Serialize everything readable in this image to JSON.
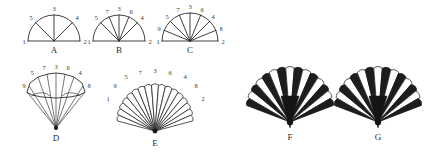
{
  "figure": {
    "background_color": "#ffffff",
    "ink_color": "#2b2b2b",
    "fill_dark_color": "#1d1d1d",
    "panel_count": 7
  },
  "panels": [
    {
      "id": "A",
      "label": "A",
      "kind": "semicircle-radii",
      "ray_count": 3,
      "baseline_labels": [
        "1",
        "2"
      ],
      "arc_labels": [
        "5",
        "3",
        "4"
      ],
      "label_left": "1",
      "label_right": "2",
      "center_x": 54,
      "center_y": 41,
      "radius": 26
    },
    {
      "id": "B",
      "label": "B",
      "kind": "semicircle-radii",
      "ray_count": 5,
      "baseline_labels": [
        "1",
        "2"
      ],
      "arc_labels": [
        "5",
        "7",
        "3",
        "6",
        "4"
      ],
      "label_left": "1",
      "label_right": "2",
      "center_x": 119,
      "center_y": 41,
      "radius": 26
    },
    {
      "id": "C",
      "label": "C",
      "kind": "semicircle-radii",
      "ray_count": 7,
      "baseline_labels": [
        "1",
        "2"
      ],
      "arc_labels": [
        "9",
        "5",
        "7",
        "3",
        "6",
        "4",
        "8"
      ],
      "label_left": "1",
      "label_right": "2",
      "center_x": 190,
      "center_y": 41,
      "radius": 28
    },
    {
      "id": "D",
      "label": "D",
      "kind": "narrow-fan",
      "ray_count": 7,
      "arc_labels": [
        "9",
        "5",
        "7",
        "3",
        "6",
        "4",
        "8"
      ],
      "center_x": 56,
      "center_y": 128,
      "radius": 48
    },
    {
      "id": "E",
      "label": "E",
      "kind": "scalloped-fan",
      "blade_count": 17,
      "arc_labels": [
        "1",
        "9",
        "5",
        "7",
        "3",
        "6",
        "4",
        "8",
        "2"
      ],
      "center_x": 155,
      "center_y": 131,
      "radius": 46
    },
    {
      "id": "F",
      "label": "F",
      "kind": "solid-scalloped-fan",
      "blade_count": 15,
      "arc_labels": [],
      "center_x": 290,
      "center_y": 122,
      "radius": 54
    },
    {
      "id": "G",
      "label": "G",
      "kind": "solid-scalloped-fan",
      "blade_count": 15,
      "arc_labels": [],
      "center_x": 378,
      "center_y": 122,
      "radius": 54
    }
  ],
  "chart_data": {
    "type": "diagram",
    "panels": [
      "A",
      "B",
      "C",
      "D",
      "E",
      "F",
      "G"
    ],
    "ray_counts": [
      3,
      5,
      7,
      7,
      17,
      15,
      15
    ],
    "vertex_label_sets": [
      [
        "1",
        "5",
        "3",
        "4",
        "2"
      ],
      [
        "1",
        "5",
        "7",
        "3",
        "6",
        "4",
        "2"
      ],
      [
        "1",
        "9",
        "5",
        "7",
        "3",
        "6",
        "4",
        "8",
        "2"
      ],
      [
        "9",
        "5",
        "7",
        "3",
        "6",
        "4",
        "8"
      ],
      [
        "1",
        "9",
        "5",
        "7",
        "3",
        "6",
        "4",
        "8",
        "2"
      ],
      [],
      []
    ]
  }
}
